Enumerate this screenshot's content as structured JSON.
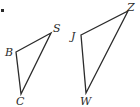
{
  "marker": {
    "x": 2,
    "y": 10
  },
  "triangles": [
    {
      "name": "triangle-bsc",
      "vertices": [
        {
          "label": "B",
          "x": 16,
          "y": 52,
          "lx": 5,
          "ly": 56
        },
        {
          "label": "S",
          "x": 51,
          "y": 33,
          "lx": 53,
          "ly": 32
        },
        {
          "label": "C",
          "x": 21,
          "y": 94,
          "lx": 16,
          "ly": 105
        }
      ],
      "points": "16,52 51,33 21,94"
    },
    {
      "name": "triangle-jzw",
      "vertices": [
        {
          "label": "J",
          "x": 81,
          "y": 35,
          "lx": 71,
          "ly": 40
        },
        {
          "label": "Z",
          "x": 128,
          "y": 11,
          "lx": 127,
          "ly": 11
        },
        {
          "label": "W",
          "x": 86,
          "y": 93,
          "lx": 80,
          "ly": 105
        }
      ],
      "points": "81,35 128,11 86,93"
    }
  ]
}
